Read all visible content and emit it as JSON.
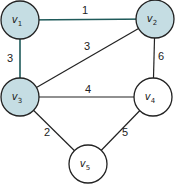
{
  "graph": {
    "colors": {
      "highlight_fill": "#c5dde3",
      "plain_fill": "#ffffff",
      "node_stroke": "#222222",
      "highlight_edge": "#1f5a5a",
      "plain_edge": "#222222"
    },
    "nodes": [
      {
        "id": "v1",
        "label": "v",
        "sub": "1",
        "x": 20,
        "y": 20,
        "highlighted": true
      },
      {
        "id": "v2",
        "label": "v",
        "sub": "2",
        "x": 155,
        "y": 19,
        "highlighted": true
      },
      {
        "id": "v3",
        "label": "v",
        "sub": "3",
        "x": 20,
        "y": 97,
        "highlighted": true
      },
      {
        "id": "v4",
        "label": "v",
        "sub": "4",
        "x": 153,
        "y": 97,
        "highlighted": false
      },
      {
        "id": "v5",
        "label": "v",
        "sub": "5",
        "x": 88,
        "y": 164,
        "highlighted": false
      }
    ],
    "edges": [
      {
        "from": "v1",
        "to": "v2",
        "weight": "1",
        "highlighted": true,
        "lx": 85,
        "ly": 14
      },
      {
        "from": "v1",
        "to": "v3",
        "weight": "3",
        "highlighted": true,
        "lx": 10,
        "ly": 62
      },
      {
        "from": "v3",
        "to": "v2",
        "weight": "3",
        "highlighted": false,
        "lx": 87,
        "ly": 50
      },
      {
        "from": "v2",
        "to": "v4",
        "weight": "6",
        "highlighted": false,
        "lx": 161,
        "ly": 60
      },
      {
        "from": "v3",
        "to": "v4",
        "weight": "4",
        "highlighted": false,
        "lx": 88,
        "ly": 93
      },
      {
        "from": "v3",
        "to": "v5",
        "weight": "2",
        "highlighted": false,
        "lx": 47,
        "ly": 136
      },
      {
        "from": "v4",
        "to": "v5",
        "weight": "5",
        "highlighted": false,
        "lx": 125,
        "ly": 136
      }
    ]
  }
}
